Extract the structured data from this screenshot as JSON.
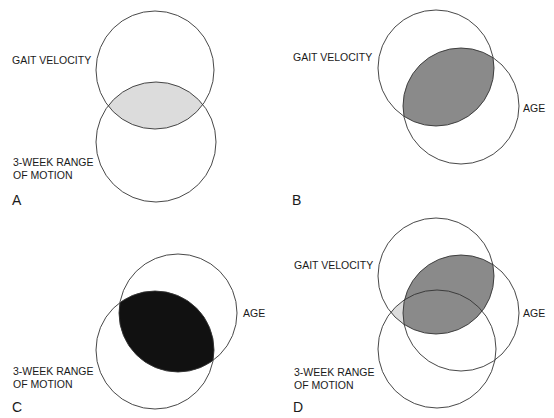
{
  "figure": {
    "colors": {
      "background": "#ffffff",
      "stroke": "#333333",
      "text": "#1a1a1a",
      "light_shade": "#dcdcdc",
      "medium_shade": "#8a8a8a",
      "dark_shade": "#111111"
    },
    "panels": [
      {
        "letter": "A",
        "labels": {
          "gait_velocity": "GAIT VELOCITY",
          "rom_line1": "3-WEEK RANGE",
          "rom_line2": "OF MOTION"
        },
        "circles": [
          {
            "name": "Gait velocity",
            "cx": 155,
            "cy": 70,
            "r": 59
          },
          {
            "name": "3-week range of motion",
            "cx": 156,
            "cy": 142,
            "r": 60
          }
        ],
        "shaded_overlap": "Gait velocity ∩ 3-week range of motion",
        "shade": "light"
      },
      {
        "letter": "B",
        "labels": {
          "gait_velocity": "GAIT VELOCITY",
          "age": "AGE"
        },
        "circles": [
          {
            "name": "Gait velocity",
            "cx": 436,
            "cy": 68,
            "r": 58
          },
          {
            "name": "Age",
            "cx": 461,
            "cy": 106,
            "r": 58
          }
        ],
        "shaded_overlap": "Gait velocity ∩ Age",
        "shade": "medium"
      },
      {
        "letter": "C",
        "labels": {
          "age": "AGE",
          "rom_line1": "3-WEEK RANGE",
          "rom_line2": "OF MOTION"
        },
        "circles": [
          {
            "name": "Age",
            "cx": 178,
            "cy": 313,
            "r": 59
          },
          {
            "name": "3-week range of motion",
            "cx": 155,
            "cy": 350,
            "r": 59
          }
        ],
        "shaded_overlap": "Age ∩ 3-week range of motion",
        "shade": "dark"
      },
      {
        "letter": "D",
        "labels": {
          "gait_velocity": "GAIT VELOCITY",
          "age": "AGE",
          "rom_line1": "3-WEEK RANGE",
          "rom_line2": "OF MOTION"
        },
        "circles": [
          {
            "name": "Gait velocity",
            "cx": 436,
            "cy": 276,
            "r": 58
          },
          {
            "name": "Age",
            "cx": 461,
            "cy": 313,
            "r": 58
          },
          {
            "name": "3-week range of motion",
            "cx": 437,
            "cy": 349,
            "r": 59
          }
        ],
        "shaded_overlap": "Gait velocity ∩ Age (medium); Gait velocity ∩ 3-week ROM outside Age (light)",
        "shade": "medium+light"
      }
    ]
  }
}
